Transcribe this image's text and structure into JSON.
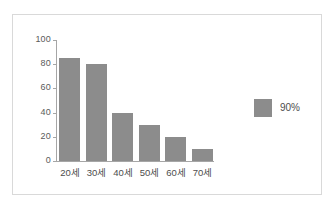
{
  "chart_data": {
    "type": "bar",
    "title": "",
    "xlabel": "",
    "ylabel": "",
    "categories": [
      "20세",
      "30세",
      "40세",
      "50세",
      "60세",
      "70세"
    ],
    "values": [
      85,
      80,
      40,
      30,
      20,
      10
    ],
    "series": [
      {
        "name": "90%",
        "values": [
          85,
          80,
          40,
          30,
          20,
          10
        ]
      }
    ],
    "ylim": [
      0,
      100
    ],
    "yticks": [
      100,
      80,
      60,
      40,
      20,
      0
    ],
    "ytick_labels": [
      "100",
      "80",
      "60",
      "40",
      "20",
      "0"
    ],
    "grid": false,
    "legend": {
      "position": "right",
      "entries": [
        {
          "label": "90%",
          "color": "#8c8c8c"
        }
      ]
    },
    "colors": {
      "bar": "#8c8c8c",
      "axis": "#a6a6a6",
      "frame": "#d9d9d9",
      "tick_text": "#5a5a5a",
      "category_text": "#4d4d4d",
      "background": "#ffffff"
    }
  }
}
